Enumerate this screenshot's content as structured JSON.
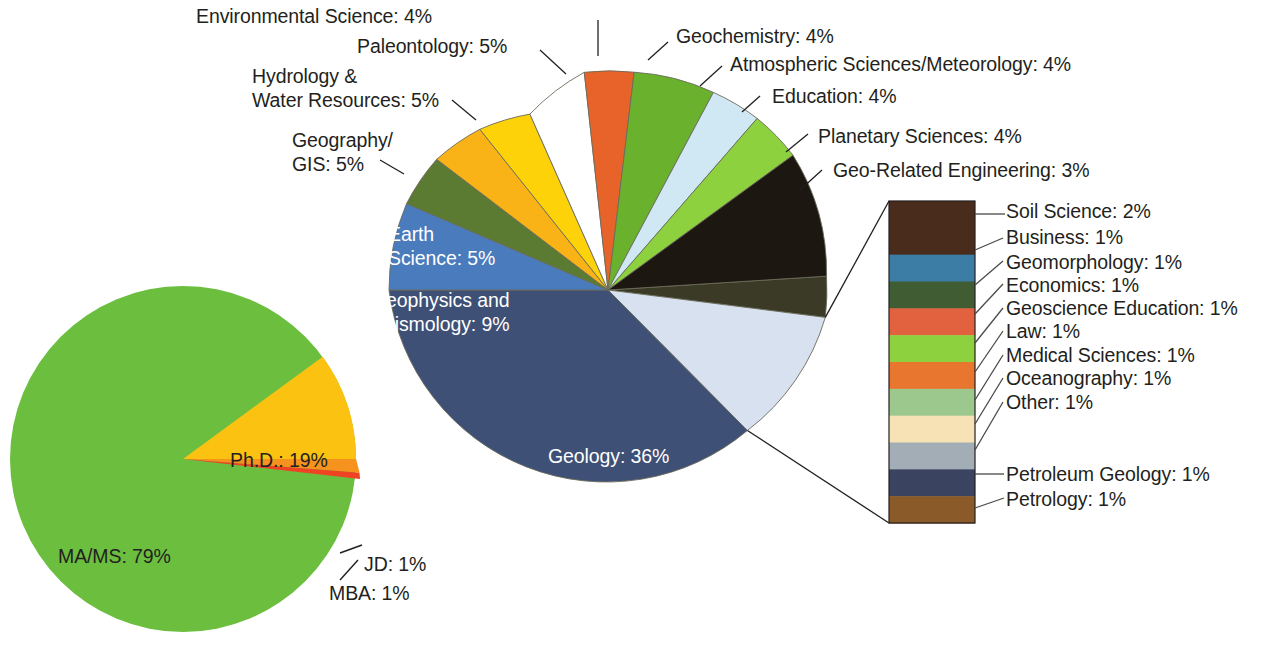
{
  "chart_data": [
    {
      "type": "pie",
      "name": "degree-type-pie",
      "title": "",
      "categories": [
        "MA/MS",
        "Ph.D.",
        "JD",
        "MBA"
      ],
      "values": [
        79,
        19,
        1,
        1
      ],
      "labels": [
        "MA/MS: 79%",
        "Ph.D.: 19%",
        "JD: 1%",
        "MBA: 1%"
      ],
      "colors": [
        "#6cbe3f",
        "#fcc211",
        "#f6921e",
        "#ef4323"
      ],
      "legend": "inline-callout"
    },
    {
      "type": "pie",
      "name": "discipline-pie",
      "title": "",
      "categories": [
        "Geology",
        "Geophysics and Seismology",
        "Earth Science",
        "Geography/GIS",
        "Hydrology & Water Resources",
        "Paleontology",
        "Environmental Science",
        "Geochemistry",
        "Atmospheric Sciences/Meteorology",
        "Education",
        "Planetary Sciences",
        "Geo-Related Engineering",
        "Grouped Other Disciplines"
      ],
      "values": [
        36,
        9,
        5,
        5,
        5,
        5,
        4,
        4,
        4,
        4,
        4,
        3,
        12
      ],
      "labels": [
        "Geology: 36%",
        "Geophysics and Seismology: 9%",
        "Earth Science: 5%",
        "Geography/GIS: 5%",
        "Hydrology & Water Resources: 5%",
        "Paleontology: 5%",
        "Environmental Science: 4%",
        "Geochemistry: 4%",
        "Atmospheric Sciences/Meteorology: 4%",
        "Education: 4%",
        "Planetary Sciences: 4%",
        "Geo-Related Engineering: 3%",
        ""
      ],
      "colors": [
        "#3e5075",
        "#4a7bbd",
        "#5b7b33",
        "#f9b316",
        "#fdd208",
        "#ffffff",
        "#e8632a",
        "#6ab22e",
        "#cfe8f3",
        "#8ed13e",
        "#1c1710",
        "#3a3a26",
        "#d8e1ef"
      ],
      "legend": "exploded-bar-right"
    },
    {
      "type": "bar",
      "name": "grouped-disciplines-legend",
      "orientation": "vertical-stack",
      "categories": [
        "Soil Science",
        "Business",
        "Geomorphology",
        "Economics",
        "Geoscience Education",
        "Law",
        "Medical Sciences",
        "Oceanography",
        "Other",
        "Petroleum Geology",
        "Petrology"
      ],
      "values": [
        2,
        1,
        1,
        1,
        1,
        1,
        1,
        1,
        1,
        1,
        1
      ],
      "labels": [
        "Soil Science: 2%",
        "Business: 1%",
        "Geomorphology: 1%",
        "Economics: 1%",
        "Geoscience Education: 1%",
        "Law: 1%",
        "Medical Sciences: 1%",
        "Oceanography: 1%",
        "Other: 1%",
        "Petroleum Geology: 1%",
        "Petrology: 1%"
      ],
      "colors": [
        "#4a2c1c",
        "#3c7da6",
        "#3f5c32",
        "#e2623f",
        "#8ed13e",
        "#e8762e",
        "#9cc88d",
        "#f6e2b4",
        "#a2adb5",
        "#3a4360",
        "#8a5a28"
      ],
      "total": 12
    }
  ],
  "degree_pie": {
    "slices": [
      {
        "label": "MA/MS: 79%",
        "name": "ma-ms",
        "value": 79,
        "color": "#6cbe3f"
      },
      {
        "label": "Ph.D.: 19%",
        "name": "phd",
        "value": 19,
        "color": "#fcc211"
      },
      {
        "label": "JD: 1%",
        "name": "jd",
        "value": 1,
        "color": "#f6921e"
      },
      {
        "label": "MBA: 1%",
        "name": "mba",
        "value": 1,
        "color": "#ef4323"
      }
    ]
  },
  "discipline_pie": {
    "inside_labels": {
      "geology": "Geology: 36%",
      "geophysics_line1": "Geophysics and",
      "geophysics_line2": "Seismology: 9%",
      "earth_line1": "Earth",
      "earth_line2": "Science: 5%"
    },
    "outside_labels": {
      "environmental_science": "Environmental Science: 4%",
      "paleontology": "Paleontology: 5%",
      "hydrology_line1": "Hydrology &",
      "hydrology_line2": "Water Resources: 5%",
      "geography_line1": "Geography/",
      "geography_line2": "GIS: 5%",
      "geochemistry": "Geochemistry: 4%",
      "atmospheric": "Atmospheric Sciences/Meteorology: 4%",
      "education": "Education: 4%",
      "planetary": "Planetary Sciences: 4%",
      "geo_engineering": "Geo-Related Engineering: 3%"
    }
  },
  "legend_bar": {
    "items": [
      {
        "label": "Soil Science: 2%",
        "color": "#4a2c1c",
        "value": 2
      },
      {
        "label": "Business: 1%",
        "color": "#3c7da6",
        "value": 1
      },
      {
        "label": "Geomorphology: 1%",
        "color": "#3f5c32",
        "value": 1
      },
      {
        "label": "Economics: 1%",
        "color": "#e2623f",
        "value": 1
      },
      {
        "label": "Geoscience Education: 1%",
        "color": "#8ed13e",
        "value": 1
      },
      {
        "label": "Law: 1%",
        "color": "#e8762e",
        "value": 1
      },
      {
        "label": "Medical Sciences: 1%",
        "color": "#9cc88d",
        "value": 1
      },
      {
        "label": "Oceanography: 1%",
        "color": "#f6e2b4",
        "value": 1
      },
      {
        "label": "Other: 1%",
        "color": "#a2adb5",
        "value": 1
      },
      {
        "label": "Petroleum Geology: 1%",
        "color": "#3a4360",
        "value": 1
      },
      {
        "label": "Petrology: 1%",
        "color": "#8a5a28",
        "value": 1
      }
    ]
  }
}
